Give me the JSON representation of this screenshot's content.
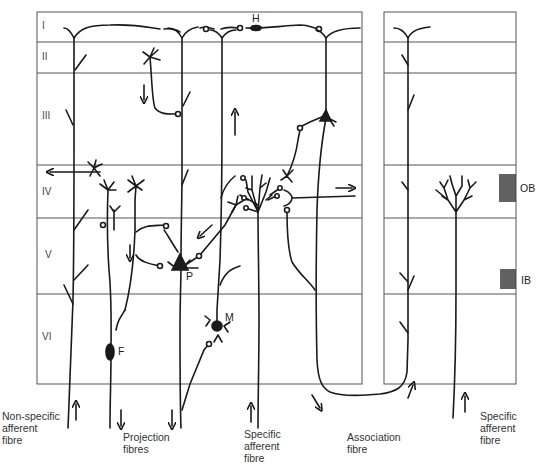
{
  "layers": [
    {
      "label": "I",
      "y": 26
    },
    {
      "label": "II",
      "y": 57
    },
    {
      "label": "III",
      "y": 116
    },
    {
      "label": "IV",
      "y": 192
    },
    {
      "label": "V",
      "y": 255
    },
    {
      "label": "VI",
      "y": 337
    }
  ],
  "cells": {
    "horizontal": "H",
    "pyramidal": "P",
    "martinotti": "M",
    "fusiform": "F"
  },
  "bands": {
    "outer": "OB",
    "inner": "IB"
  },
  "captions": {
    "non_specific_afferent": "Non-specific\nafferent\nfibre",
    "projection": "Projection\nfibres",
    "specific_afferent_left": "Specific\nafferent\nfibre",
    "association": "Association\nfibre",
    "specific_afferent_right": "Specific\nafferent\nfibre"
  },
  "colors": {
    "ink": "#1a1a1a",
    "grid": "#555555",
    "band": "#3a3a3a"
  }
}
